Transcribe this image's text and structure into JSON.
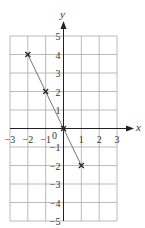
{
  "chart_data": {
    "type": "line",
    "title": "",
    "xlabel": "x",
    "ylabel": "y",
    "xlim": [
      -3,
      3
    ],
    "ylim": [
      -5,
      5
    ],
    "grid": true,
    "x_ticks": [
      "-3",
      "-2",
      "-1",
      "0",
      "1",
      "2",
      "3"
    ],
    "y_ticks": [
      "5",
      "4",
      "3",
      "2",
      "1",
      "-1",
      "-2",
      "-3",
      "-4",
      "-5"
    ],
    "series": [
      {
        "name": "line",
        "x": [
          -2,
          -1,
          0,
          1
        ],
        "y": [
          4,
          2,
          0,
          -2
        ],
        "marker": "x"
      }
    ],
    "colors": {
      "grid": "#aaaaaa",
      "axis": "#222222",
      "line": "#777777",
      "marker": "#222222"
    }
  }
}
